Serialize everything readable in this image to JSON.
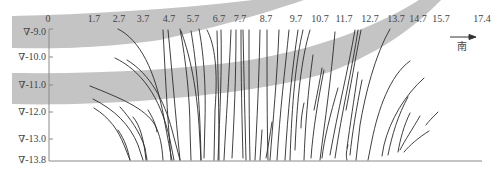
{
  "diagram": {
    "title": "",
    "x_axis": {
      "ticks": [
        "0",
        "1.7",
        "2.7",
        "3.7",
        "4.7",
        "5.7",
        "6.7",
        "7.7",
        "8.7",
        "9.7",
        "10.7",
        "11.7",
        "12.7",
        "13.7",
        "14.7",
        "15.7",
        "17.4"
      ],
      "tick_x": [
        48,
        94,
        119,
        143,
        169,
        193,
        219,
        240,
        266,
        296,
        320,
        343,
        370,
        396,
        418,
        441,
        482
      ]
    },
    "y_axis": {
      "ticks": [
        "∇-9.0",
        "∇-10.0",
        "∇-11.0",
        "∇-12.0",
        "∇-13.0",
        "∇-13.8"
      ],
      "tick_y": [
        32,
        57,
        85,
        112,
        139,
        160
      ]
    },
    "direction": {
      "label": "南",
      "meaning": "south"
    },
    "bands": [
      {
        "name": "upper-gray-stratum",
        "color": "#c4c4c4"
      },
      {
        "name": "lower-gray-stratum",
        "color": "#c4c4c4"
      }
    ],
    "colors": {
      "band": "#c4c4c4",
      "fracture": "#2a2a2a",
      "axis": "#8a8a8a",
      "text": "#444444"
    }
  }
}
